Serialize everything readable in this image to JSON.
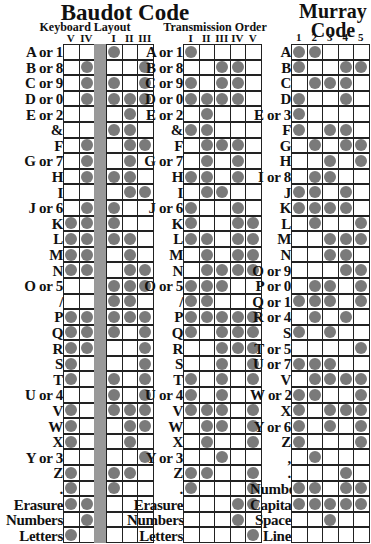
{
  "baudot": {
    "title": "Baudot Code",
    "keyboard": {
      "subtitle": "Keyboard Layout",
      "columns": [
        "V",
        "IV",
        "",
        "I",
        "II",
        "III"
      ],
      "rows": [
        {
          "label": "A or 1",
          "holes": [
            0,
            0,
            0,
            1,
            0,
            0
          ]
        },
        {
          "label": "B or 8",
          "holes": [
            0,
            1,
            0,
            0,
            0,
            1
          ]
        },
        {
          "label": "C or 9",
          "holes": [
            0,
            1,
            0,
            1,
            0,
            1
          ]
        },
        {
          "label": "D or 0",
          "holes": [
            0,
            1,
            0,
            1,
            1,
            1
          ]
        },
        {
          "label": "E or 2",
          "holes": [
            0,
            0,
            0,
            0,
            1,
            0
          ]
        },
        {
          "label": "&",
          "holes": [
            0,
            0,
            0,
            1,
            1,
            0
          ]
        },
        {
          "label": "F",
          "holes": [
            0,
            1,
            0,
            0,
            1,
            1
          ]
        },
        {
          "label": "G or 7",
          "holes": [
            0,
            1,
            0,
            0,
            1,
            0
          ]
        },
        {
          "label": "H",
          "holes": [
            0,
            1,
            0,
            1,
            1,
            0
          ]
        },
        {
          "label": "I",
          "holes": [
            0,
            0,
            0,
            0,
            1,
            1
          ]
        },
        {
          "label": "J or 6",
          "holes": [
            0,
            1,
            0,
            1,
            0,
            0
          ]
        },
        {
          "label": "K",
          "holes": [
            1,
            1,
            0,
            1,
            0,
            0
          ]
        },
        {
          "label": "L",
          "holes": [
            1,
            1,
            0,
            1,
            1,
            0
          ]
        },
        {
          "label": "M",
          "holes": [
            1,
            1,
            0,
            0,
            1,
            0
          ]
        },
        {
          "label": "N",
          "holes": [
            1,
            1,
            0,
            0,
            1,
            1
          ]
        },
        {
          "label": "O or 5",
          "holes": [
            0,
            0,
            0,
            1,
            1,
            1
          ]
        },
        {
          "label": "/",
          "holes": [
            0,
            0,
            0,
            1,
            1,
            0
          ]
        },
        {
          "label": "P",
          "holes": [
            1,
            1,
            0,
            1,
            1,
            1
          ]
        },
        {
          "label": "Q",
          "holes": [
            1,
            1,
            0,
            1,
            0,
            1
          ]
        },
        {
          "label": "R",
          "holes": [
            1,
            1,
            0,
            0,
            0,
            1
          ]
        },
        {
          "label": "S",
          "holes": [
            1,
            0,
            0,
            0,
            0,
            1
          ]
        },
        {
          "label": "T",
          "holes": [
            1,
            0,
            0,
            1,
            0,
            1
          ]
        },
        {
          "label": "U or 4",
          "holes": [
            0,
            0,
            0,
            1,
            0,
            1
          ]
        },
        {
          "label": "V",
          "holes": [
            1,
            0,
            0,
            1,
            1,
            1
          ]
        },
        {
          "label": "W",
          "holes": [
            1,
            0,
            0,
            0,
            1,
            1
          ]
        },
        {
          "label": "X",
          "holes": [
            1,
            0,
            0,
            0,
            1,
            0
          ]
        },
        {
          "label": "Y or 3",
          "holes": [
            0,
            0,
            0,
            0,
            0,
            1
          ]
        },
        {
          "label": "Z",
          "holes": [
            1,
            0,
            0,
            1,
            1,
            0
          ]
        },
        {
          "label": ".",
          "holes": [
            1,
            0,
            0,
            1,
            0,
            0
          ]
        },
        {
          "label": "Erasure",
          "holes": [
            1,
            1,
            0,
            0,
            0,
            0
          ]
        },
        {
          "label": "Numbers",
          "holes": [
            0,
            1,
            0,
            0,
            0,
            0
          ]
        },
        {
          "label": "Letters",
          "holes": [
            1,
            0,
            0,
            0,
            0,
            0
          ]
        }
      ]
    },
    "transmission": {
      "subtitle": "Transmission Order",
      "columns": [
        "I",
        "II",
        "III",
        "IV",
        "V"
      ],
      "rows": [
        {
          "label": "A or 1",
          "holes": [
            1,
            0,
            0,
            0,
            0
          ]
        },
        {
          "label": "B or 8",
          "holes": [
            0,
            0,
            1,
            1,
            0
          ]
        },
        {
          "label": "C or 9",
          "holes": [
            1,
            0,
            1,
            1,
            0
          ]
        },
        {
          "label": "D or 0",
          "holes": [
            1,
            1,
            1,
            1,
            0
          ]
        },
        {
          "label": "E or 2",
          "holes": [
            0,
            1,
            0,
            0,
            0
          ]
        },
        {
          "label": "&",
          "holes": [
            1,
            1,
            0,
            0,
            0
          ]
        },
        {
          "label": "F",
          "holes": [
            0,
            1,
            1,
            1,
            0
          ]
        },
        {
          "label": "G or 7",
          "holes": [
            0,
            1,
            0,
            1,
            0
          ]
        },
        {
          "label": "H",
          "holes": [
            1,
            1,
            0,
            1,
            0
          ]
        },
        {
          "label": "I",
          "holes": [
            0,
            1,
            1,
            0,
            0
          ]
        },
        {
          "label": "J or 6",
          "holes": [
            1,
            0,
            0,
            1,
            0
          ]
        },
        {
          "label": "K",
          "holes": [
            1,
            0,
            0,
            1,
            1
          ]
        },
        {
          "label": "L",
          "holes": [
            1,
            1,
            0,
            1,
            1
          ]
        },
        {
          "label": "M",
          "holes": [
            0,
            1,
            0,
            1,
            1
          ]
        },
        {
          "label": "N",
          "holes": [
            0,
            1,
            1,
            1,
            1
          ]
        },
        {
          "label": "O or 5",
          "holes": [
            1,
            1,
            1,
            0,
            0
          ]
        },
        {
          "label": "/",
          "holes": [
            1,
            1,
            0,
            0,
            0
          ]
        },
        {
          "label": "P",
          "holes": [
            1,
            1,
            1,
            1,
            1
          ]
        },
        {
          "label": "Q",
          "holes": [
            1,
            0,
            1,
            1,
            1
          ]
        },
        {
          "label": "R",
          "holes": [
            0,
            0,
            1,
            1,
            1
          ]
        },
        {
          "label": "S",
          "holes": [
            0,
            0,
            1,
            0,
            1
          ]
        },
        {
          "label": "T",
          "holes": [
            1,
            0,
            1,
            0,
            1
          ]
        },
        {
          "label": "U or 4",
          "holes": [
            1,
            0,
            1,
            0,
            0
          ]
        },
        {
          "label": "V",
          "holes": [
            1,
            1,
            1,
            0,
            1
          ]
        },
        {
          "label": "W",
          "holes": [
            0,
            1,
            1,
            0,
            1
          ]
        },
        {
          "label": "X",
          "holes": [
            0,
            1,
            0,
            0,
            1
          ]
        },
        {
          "label": "Y or 3",
          "holes": [
            0,
            0,
            1,
            0,
            0
          ]
        },
        {
          "label": "Z",
          "holes": [
            1,
            1,
            0,
            0,
            1
          ]
        },
        {
          "label": ".",
          "holes": [
            1,
            0,
            0,
            0,
            1
          ]
        },
        {
          "label": "Erasure",
          "holes": [
            0,
            0,
            0,
            1,
            1
          ]
        },
        {
          "label": "Numbers",
          "holes": [
            0,
            0,
            0,
            1,
            0
          ]
        },
        {
          "label": "Letters",
          "holes": [
            0,
            0,
            0,
            0,
            1
          ]
        }
      ]
    }
  },
  "murray": {
    "title_line1": "Murray",
    "title_line2": "Code",
    "columns": [
      "1",
      "2",
      "3",
      "4",
      "5"
    ],
    "rows": [
      {
        "label": "A",
        "holes": [
          1,
          1,
          0,
          0,
          0
        ]
      },
      {
        "label": "B",
        "holes": [
          1,
          0,
          0,
          1,
          1
        ]
      },
      {
        "label": "C",
        "holes": [
          0,
          1,
          1,
          1,
          0
        ]
      },
      {
        "label": "D",
        "holes": [
          1,
          0,
          0,
          1,
          0
        ]
      },
      {
        "label": "E or 3",
        "holes": [
          1,
          0,
          0,
          0,
          0
        ]
      },
      {
        "label": "F",
        "holes": [
          1,
          0,
          1,
          1,
          0
        ]
      },
      {
        "label": "G",
        "holes": [
          0,
          1,
          0,
          1,
          1
        ]
      },
      {
        "label": "H",
        "holes": [
          0,
          0,
          1,
          0,
          1
        ]
      },
      {
        "label": "I or 8",
        "holes": [
          0,
          1,
          1,
          0,
          0
        ]
      },
      {
        "label": "J",
        "holes": [
          1,
          1,
          0,
          1,
          0
        ]
      },
      {
        "label": "K",
        "holes": [
          1,
          1,
          1,
          1,
          0
        ]
      },
      {
        "label": "L",
        "holes": [
          0,
          1,
          0,
          0,
          1
        ]
      },
      {
        "label": "M",
        "holes": [
          0,
          0,
          1,
          1,
          1
        ]
      },
      {
        "label": "N",
        "holes": [
          0,
          0,
          1,
          1,
          0
        ]
      },
      {
        "label": "O or 9",
        "holes": [
          0,
          0,
          0,
          1,
          1
        ]
      },
      {
        "label": "P or 0",
        "holes": [
          0,
          1,
          1,
          0,
          1
        ]
      },
      {
        "label": "Q or 1",
        "holes": [
          1,
          1,
          1,
          0,
          1
        ]
      },
      {
        "label": "R or 4",
        "holes": [
          0,
          1,
          0,
          1,
          0
        ]
      },
      {
        "label": "S",
        "holes": [
          1,
          0,
          1,
          0,
          0
        ]
      },
      {
        "label": "T or 5",
        "holes": [
          0,
          0,
          0,
          0,
          1
        ]
      },
      {
        "label": "U or 7",
        "holes": [
          1,
          1,
          1,
          0,
          0
        ]
      },
      {
        "label": "V",
        "holes": [
          0,
          1,
          1,
          1,
          1
        ]
      },
      {
        "label": "W or 2",
        "holes": [
          1,
          1,
          0,
          0,
          1
        ]
      },
      {
        "label": "X",
        "holes": [
          1,
          0,
          1,
          1,
          1
        ]
      },
      {
        "label": "Y or 6",
        "holes": [
          1,
          0,
          1,
          0,
          1
        ]
      },
      {
        "label": "Z",
        "holes": [
          1,
          0,
          0,
          0,
          1
        ]
      },
      {
        "label": ",",
        "holes": [
          0,
          1,
          0,
          0,
          0
        ]
      },
      {
        "label": ".",
        "holes": [
          0,
          0,
          0,
          1,
          0
        ]
      },
      {
        "label": "Numbers",
        "holes": [
          1,
          1,
          0,
          1,
          1
        ]
      },
      {
        "label": "Capitals",
        "holes": [
          1,
          1,
          1,
          1,
          1
        ]
      },
      {
        "label": "Space",
        "holes": [
          0,
          0,
          1,
          0,
          0
        ]
      },
      {
        "label": "Line",
        "holes": [
          0,
          0,
          0,
          0,
          0
        ]
      }
    ]
  },
  "colors": {
    "hole": "#7a7a7a",
    "feed_strip": "#999999",
    "grid": "#222222"
  }
}
